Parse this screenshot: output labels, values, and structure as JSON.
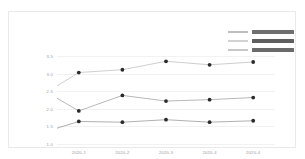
{
  "chart_data": {
    "type": "line",
    "title": "",
    "subtitle": "",
    "xlabel": "",
    "ylabel": "",
    "x": [
      "2020-1",
      "2020-2",
      "2020-3",
      "2020-4",
      "2020-4"
    ],
    "categories": [
      "2020-1",
      "2020-2",
      "2020-3",
      "2020-4",
      "2020-4"
    ],
    "ylim": [
      1.0,
      3.5
    ],
    "yticks": [
      "1.0",
      "1.5",
      "2.0",
      "2.5",
      "3.0",
      "3.5"
    ],
    "ytick_values": [
      1.0,
      1.5,
      2.0,
      2.5,
      3.0,
      3.5
    ],
    "grid": true,
    "legend_position": "top-right",
    "series": [
      {
        "name": "",
        "color": "#b9b9b9",
        "start_value": 2.65,
        "values": [
          3.03,
          3.11,
          3.35,
          3.25,
          3.33
        ]
      },
      {
        "name": "",
        "color": "#9a9a9a",
        "start_value": 2.3,
        "values": [
          1.94,
          2.38,
          2.22,
          2.26,
          2.32
        ]
      },
      {
        "name": "",
        "color": "#8e8e8e",
        "start_value": 1.45,
        "values": [
          1.64,
          1.62,
          1.69,
          1.62,
          1.66
        ]
      }
    ]
  },
  "legend": {
    "entries": [
      {
        "label": "",
        "color": "#bdbdbd",
        "bar_color": "#6f6f6f"
      },
      {
        "label": "",
        "color": "#d2d2d2",
        "bar_color": "#5f5f5f"
      },
      {
        "label": "",
        "color": "#c7c7c7",
        "bar_color": "#6a6a6a"
      }
    ]
  },
  "colors": {
    "background": "#ffffff",
    "frame": "#e9e9e9",
    "gridline": "#f2f2f2",
    "tick_text": "#9a9a9a",
    "marker": "#2b2b2b"
  }
}
